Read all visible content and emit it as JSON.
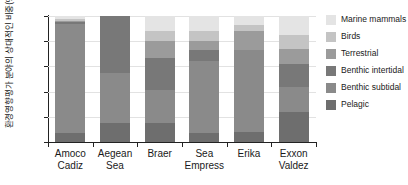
{
  "chart_data": {
    "type": "bar",
    "stacked": true,
    "stack_total": 100,
    "title": "",
    "xlabel": "",
    "ylabel": "환경영향평가 분야의 상대적인 비중(%)",
    "ylim": [
      0,
      100
    ],
    "yticks": [
      0,
      20,
      40,
      60,
      80,
      100
    ],
    "grid": true,
    "legend_position": "right",
    "categories": [
      "Amoco Cadiz",
      "Aegean Sea",
      "Braer",
      "Sea Empress",
      "Erika",
      "Exxon Valdez"
    ],
    "category_lines": [
      [
        "Amoco",
        "Cadiz"
      ],
      [
        "Aegean",
        "Sea"
      ],
      [
        "Braer",
        ""
      ],
      [
        "Sea",
        "Empress"
      ],
      [
        "Erika",
        ""
      ],
      [
        "Exxon",
        "Valdez"
      ]
    ],
    "series": [
      {
        "name": "Pelagic",
        "color": "#6e6e6e",
        "values": [
          7,
          15,
          15,
          7,
          8,
          24
        ]
      },
      {
        "name": "Benthic subtidal",
        "color": "#8a8a8a",
        "values": [
          87,
          40,
          26,
          57,
          65,
          20
        ]
      },
      {
        "name": "Benthic intertidal",
        "color": "#787878",
        "values": [
          1,
          45,
          26,
          9,
          0,
          18
        ]
      },
      {
        "name": "Terrestrial",
        "color": "#9b9b9b",
        "values": [
          1,
          0,
          13,
          7,
          15,
          12
        ]
      },
      {
        "name": "Birds",
        "color": "#c4c4c4",
        "values": [
          2,
          0,
          8,
          8,
          5,
          11
        ]
      },
      {
        "name": "Marine mammals",
        "color": "#e4e4e4",
        "values": [
          2,
          0,
          12,
          12,
          7,
          15
        ]
      }
    ],
    "legend_order": [
      "Marine mammals",
      "Birds",
      "Terrestrial",
      "Benthic intertidal",
      "Benthic subtidal",
      "Pelagic"
    ]
  },
  "colors": {
    "axis": "#222222",
    "grid": "#e2e2e2",
    "background": "#ffffff",
    "text": "#1a1a1a"
  }
}
